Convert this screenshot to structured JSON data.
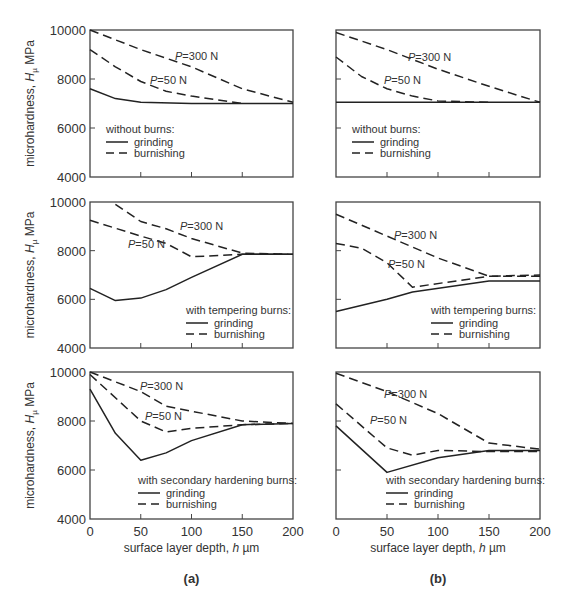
{
  "figure": {
    "captions": [
      "(a)",
      "(b)"
    ],
    "xlabel": "surface layer depth,",
    "xlabel_var": "h",
    "xlabel_unit": "µm",
    "ylabel": "microhardness,",
    "ylabel_var": "H",
    "ylabel_sub": "µ",
    "ylabel_unit": "MPa",
    "yticks": [
      "10000",
      "8000",
      "6000",
      "4000"
    ],
    "xticks": [
      "0",
      "50",
      "100",
      "150",
      "200"
    ],
    "legend_grinding": "grinding",
    "legend_burnishing": "burnishing",
    "annot_300": "=300 N",
    "annot_50": "=50 N",
    "annot_var": "P"
  },
  "chart_data": [
    {
      "type": "line",
      "panel": "(a)",
      "row": 1,
      "legend_title": "without burns:",
      "xlabel": "surface layer depth, h µm",
      "ylabel": "microhardness, Hµ MPa",
      "xlim": [
        0,
        200
      ],
      "ylim": [
        4000,
        10000
      ],
      "series": [
        {
          "name": "grinding",
          "style": "solid",
          "x": [
            0,
            25,
            50,
            100,
            200
          ],
          "y": [
            7600,
            7200,
            7050,
            7000,
            7000
          ]
        },
        {
          "name": "burnishing P=300 N",
          "style": "dashed",
          "x": [
            0,
            50,
            100,
            150,
            200
          ],
          "y": [
            10000,
            9200,
            8500,
            7600,
            7050
          ]
        },
        {
          "name": "burnishing P=50 N",
          "style": "dashed",
          "x": [
            0,
            25,
            50,
            75,
            100,
            150
          ],
          "y": [
            9200,
            8500,
            7900,
            7500,
            7300,
            7000
          ]
        }
      ]
    },
    {
      "type": "line",
      "panel": "(b)",
      "row": 1,
      "legend_title": "without burns:",
      "xlabel": "surface layer depth, h µm",
      "ylabel": "microhardness, Hµ MPa",
      "xlim": [
        0,
        200
      ],
      "ylim": [
        4000,
        10000
      ],
      "series": [
        {
          "name": "grinding",
          "style": "solid",
          "x": [
            0,
            200
          ],
          "y": [
            7050,
            7050
          ]
        },
        {
          "name": "burnishing P=300 N",
          "style": "dashed",
          "x": [
            0,
            50,
            100,
            150,
            200
          ],
          "y": [
            9900,
            9200,
            8400,
            7700,
            7050
          ]
        },
        {
          "name": "burnishing P=50 N",
          "style": "dashed",
          "x": [
            0,
            25,
            50,
            75,
            100,
            150
          ],
          "y": [
            8900,
            8100,
            7600,
            7300,
            7100,
            7050
          ]
        }
      ]
    },
    {
      "type": "line",
      "panel": "(a)",
      "row": 2,
      "legend_title": "with tempering burns:",
      "xlabel": "surface layer depth, h µm",
      "ylabel": "microhardness, Hµ MPa",
      "xlim": [
        0,
        200
      ],
      "ylim": [
        4000,
        10000
      ],
      "series": [
        {
          "name": "grinding",
          "style": "solid",
          "x": [
            0,
            25,
            50,
            75,
            100,
            150,
            200
          ],
          "y": [
            6450,
            5950,
            6050,
            6400,
            6900,
            7850,
            7850
          ]
        },
        {
          "name": "burnishing P=300 N",
          "style": "dashed",
          "x": [
            25,
            50,
            75,
            100,
            150,
            200
          ],
          "y": [
            9900,
            9200,
            8900,
            8500,
            7900,
            7850
          ]
        },
        {
          "name": "burnishing P=50 N",
          "style": "dashed",
          "x": [
            0,
            50,
            75,
            100,
            150,
            200
          ],
          "y": [
            9250,
            8600,
            8300,
            7750,
            7850,
            7850
          ]
        }
      ]
    },
    {
      "type": "line",
      "panel": "(b)",
      "row": 2,
      "legend_title": "with tempering burns:",
      "xlabel": "surface layer depth, h µm",
      "ylabel": "microhardness, Hµ MPa",
      "xlim": [
        0,
        200
      ],
      "ylim": [
        4000,
        10000
      ],
      "series": [
        {
          "name": "grinding",
          "style": "solid",
          "x": [
            0,
            50,
            75,
            150,
            200
          ],
          "y": [
            5500,
            6000,
            6300,
            6750,
            6750
          ]
        },
        {
          "name": "burnishing P=300 N",
          "style": "dashed",
          "x": [
            0,
            50,
            100,
            150,
            200
          ],
          "y": [
            9500,
            8600,
            7700,
            6950,
            7000
          ]
        },
        {
          "name": "burnishing P=50 N",
          "style": "dashed",
          "x": [
            0,
            25,
            50,
            75,
            150,
            200
          ],
          "y": [
            8300,
            8100,
            7500,
            6500,
            6950,
            6950
          ]
        }
      ]
    },
    {
      "type": "line",
      "panel": "(a)",
      "row": 3,
      "legend_title": "with secondary hardening burns:",
      "xlabel": "surface layer depth, h µm",
      "ylabel": "microhardness, Hµ MPa",
      "xlim": [
        0,
        200
      ],
      "ylim": [
        4000,
        10000
      ],
      "series": [
        {
          "name": "grinding",
          "style": "solid",
          "x": [
            0,
            25,
            50,
            75,
            100,
            150,
            200
          ],
          "y": [
            9300,
            7500,
            6400,
            6700,
            7200,
            7850,
            7900
          ]
        },
        {
          "name": "burnishing P=300 N",
          "style": "dashed",
          "x": [
            0,
            50,
            75,
            150,
            200
          ],
          "y": [
            10000,
            9200,
            8600,
            8000,
            7900
          ]
        },
        {
          "name": "burnishing P=50 N",
          "style": "dashed",
          "x": [
            0,
            50,
            75,
            100,
            150,
            200
          ],
          "y": [
            9900,
            8000,
            7550,
            7700,
            7850,
            7900
          ]
        }
      ]
    },
    {
      "type": "line",
      "panel": "(b)",
      "row": 3,
      "legend_title": "with secondary hardening burns:",
      "xlabel": "surface layer depth, h µm",
      "ylabel": "microhardness, Hµ MPa",
      "xlim": [
        0,
        200
      ],
      "ylim": [
        4000,
        10000
      ],
      "series": [
        {
          "name": "grinding",
          "style": "solid",
          "x": [
            0,
            50,
            100,
            150,
            200
          ],
          "y": [
            7800,
            5900,
            6500,
            6800,
            6800
          ]
        },
        {
          "name": "burnishing P=300 N",
          "style": "dashed",
          "x": [
            0,
            50,
            100,
            150,
            200
          ],
          "y": [
            9950,
            9200,
            8300,
            7100,
            6850
          ]
        },
        {
          "name": "burnishing P=50 N",
          "style": "dashed",
          "x": [
            0,
            50,
            75,
            100,
            150,
            200
          ],
          "y": [
            8700,
            6900,
            6600,
            6800,
            6750,
            6750
          ]
        }
      ]
    }
  ]
}
